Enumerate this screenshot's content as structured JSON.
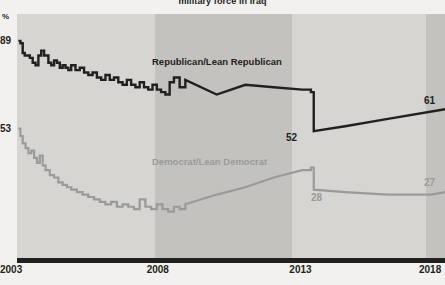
{
  "chart": {
    "title": "military force in Iraq",
    "y_unit_label": "%",
    "y_labels": [
      {
        "text": "89",
        "value": 89
      },
      {
        "text": "53",
        "value": 53
      }
    ],
    "x_ticks": [
      "2003",
      "2008",
      "2013",
      "2018"
    ],
    "series_labels": {
      "republican": "Republican/Lean Republican",
      "democrat": "Democrat/Lean Democrat"
    },
    "value_labels": {
      "rep_end": "61",
      "rep_drop": "52",
      "dem_drop": "28",
      "dem_end": "27"
    },
    "colors": {
      "republican": "#231f20",
      "democrat": "#9a9a99",
      "axis": "#231f20",
      "band_light": "#d6d5d2",
      "band_dark": "#c3c2bf",
      "page_background": "#f2f1ef"
    }
  },
  "chart_data": {
    "type": "line",
    "title": "military force in Iraq",
    "xlabel": "",
    "ylabel": "%",
    "xlim": [
      2003,
      2018
    ],
    "ylim": [
      0,
      100
    ],
    "grid": false,
    "legend": "inline-labels",
    "x_ticks": [
      2003,
      2008,
      2013,
      2018
    ],
    "y_ticks": [
      53,
      89
    ],
    "annotations": [
      {
        "text": "89",
        "x": 2003.1,
        "y": 89
      },
      {
        "text": "53",
        "x": 2003.1,
        "y": 53
      },
      {
        "text": "52",
        "x": 2013.2,
        "y": 52
      },
      {
        "text": "28",
        "x": 2013.4,
        "y": 28
      },
      {
        "text": "61",
        "x": 2018,
        "y": 61
      },
      {
        "text": "27",
        "x": 2018,
        "y": 27
      }
    ],
    "series": [
      {
        "name": "Republican/Lean Republican",
        "color": "#231f20",
        "x": [
          2003.05,
          2003.12,
          2003.2,
          2003.27,
          2003.35,
          2003.45,
          2003.55,
          2003.65,
          2003.75,
          2003.85,
          2003.95,
          2004.1,
          2004.2,
          2004.3,
          2004.4,
          2004.5,
          2004.6,
          2004.7,
          2004.8,
          2004.9,
          2005.05,
          2005.2,
          2005.35,
          2005.5,
          2005.65,
          2005.8,
          2005.95,
          2006.1,
          2006.25,
          2006.4,
          2006.55,
          2006.7,
          2006.85,
          2007.0,
          2007.15,
          2007.3,
          2007.45,
          2007.6,
          2007.75,
          2007.9,
          2008.05,
          2008.2,
          2008.35,
          2008.5,
          2008.7,
          2008.9,
          2010.0,
          2011.0,
          2012.0,
          2013.0,
          2013.3,
          2013.4,
          2014.5,
          2016.0,
          2018.0
        ],
        "y": [
          89,
          88,
          84,
          83,
          83,
          82,
          80,
          79,
          83,
          85,
          83,
          80,
          79,
          81,
          80,
          78,
          79,
          78,
          77,
          79,
          77,
          78,
          76,
          75,
          76,
          74,
          73,
          75,
          73,
          74,
          72,
          71,
          73,
          71,
          70,
          72,
          70,
          69,
          71,
          69,
          68,
          67,
          72,
          74,
          70,
          73,
          67,
          71,
          70,
          69,
          68,
          52,
          54,
          57,
          61
        ]
      },
      {
        "name": "Democrat/Lean Democrat",
        "color": "#9a9a99",
        "x": [
          2003.05,
          2003.12,
          2003.2,
          2003.3,
          2003.4,
          2003.5,
          2003.6,
          2003.7,
          2003.8,
          2003.9,
          2004.0,
          2004.15,
          2004.3,
          2004.45,
          2004.6,
          2004.75,
          2004.9,
          2005.1,
          2005.3,
          2005.5,
          2005.7,
          2005.9,
          2006.1,
          2006.3,
          2006.5,
          2006.7,
          2006.9,
          2007.1,
          2007.3,
          2007.5,
          2007.7,
          2007.9,
          2008.1,
          2008.3,
          2008.5,
          2008.7,
          2008.9,
          2010.0,
          2011.0,
          2012.0,
          2013.0,
          2013.3,
          2013.4,
          2014.5,
          2016.0,
          2017.5,
          2018.0
        ],
        "y": [
          53,
          50,
          47,
          45,
          43,
          44,
          41,
          39,
          42,
          38,
          36,
          34,
          33,
          31,
          30,
          29,
          28,
          27,
          26,
          25,
          24,
          23,
          22,
          23,
          21,
          22,
          21,
          20,
          24,
          21,
          20,
          22,
          20,
          19,
          21,
          20,
          22,
          26,
          29,
          33,
          36,
          37,
          28,
          27,
          26,
          26,
          27
        ]
      }
    ]
  },
  "bands": [
    {
      "name": "band-2003-2008",
      "x_start": 2003.0,
      "x_end": 2007.85,
      "shade": "light"
    },
    {
      "name": "band-2008-2013",
      "x_start": 2007.85,
      "x_end": 2012.65,
      "shade": "dark"
    },
    {
      "name": "band-2013-2017",
      "x_start": 2012.65,
      "x_end": 2017.35,
      "shade": "light"
    },
    {
      "name": "band-2017-2018",
      "x_start": 2017.35,
      "x_end": 2018.0,
      "shade": "dark"
    }
  ]
}
